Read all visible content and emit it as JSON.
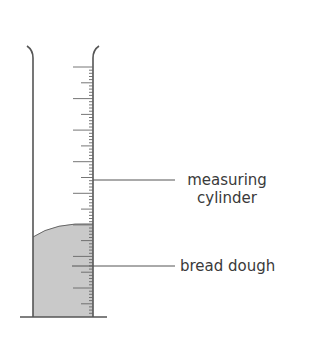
{
  "diagram": {
    "title": "",
    "labels": {
      "measuring_cylinder_line1": "measuring",
      "measuring_cylinder_line2": "cylinder",
      "bread_dough": "bread dough"
    },
    "colors": {
      "wall": "#555555",
      "tick": "#666666",
      "dough_fill": "#c9c9c9",
      "leader_line": "#555555",
      "text": "#3a3a3a",
      "background": "#ffffff"
    },
    "cylinder": {
      "left_wall_x": 33,
      "right_wall_x": 93,
      "top_y": 46,
      "base_y": 317,
      "base_x_start": 20,
      "base_x_end": 107
    },
    "scale": {
      "major_tick_ys": [
        67,
        99,
        130,
        162,
        193,
        225,
        256,
        288
      ],
      "minor_tick_spacing": 3.1,
      "unlabeled": true
    },
    "dough": {
      "surface_left_y": 237,
      "surface_right_y": 224
    },
    "leaders": {
      "cylinder": {
        "x1": 93,
        "x2": 175,
        "y": 180
      },
      "dough": {
        "x1": 72,
        "x2": 175,
        "y": 266
      }
    }
  }
}
